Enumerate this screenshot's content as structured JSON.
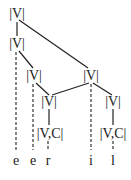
{
  "diagram": {
    "nodes": [
      {
        "id": "n1",
        "label": "|V|",
        "x": 17,
        "y": 18
      },
      {
        "id": "n2",
        "label": "|V|",
        "x": 17,
        "y": 48
      },
      {
        "id": "n3",
        "label": "|V|",
        "x": 34,
        "y": 80
      },
      {
        "id": "n4",
        "label": "|V|",
        "x": 91,
        "y": 80
      },
      {
        "id": "n5",
        "label": "|V|",
        "x": 49,
        "y": 106
      },
      {
        "id": "n6",
        "label": "|V|",
        "x": 113,
        "y": 106
      },
      {
        "id": "n7",
        "label": "|V,C|",
        "x": 50,
        "y": 137
      },
      {
        "id": "n8",
        "label": "|V,C|",
        "x": 113,
        "y": 137
      }
    ],
    "leaves": [
      {
        "id": "l1",
        "label": "e",
        "x": 16
      },
      {
        "id": "l2",
        "label": "e",
        "x": 33
      },
      {
        "id": "l3",
        "label": "r",
        "x": 48
      },
      {
        "id": "l4",
        "label": "i",
        "x": 91
      },
      {
        "id": "l5",
        "label": "l",
        "x": 113
      }
    ]
  }
}
